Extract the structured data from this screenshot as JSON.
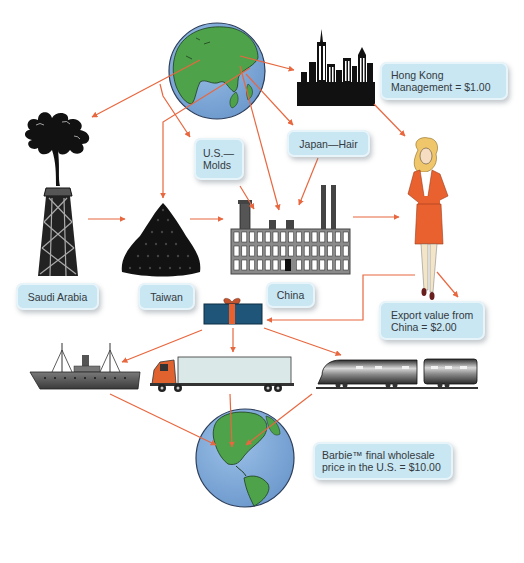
{
  "diagram": {
    "colors": {
      "arrow": "#e8673f",
      "label_bg": "#c9e6f3",
      "label_text": "#333a40",
      "ocean": "#7fa9d9",
      "land": "#3e9b3a",
      "suit": "#e9612f",
      "gift_box": "#1f5578",
      "gift_ribbon": "#e9612f"
    },
    "labels": {
      "hong_kong": [
        "Hong Kong",
        "Management = $1.00"
      ],
      "us_molds": [
        "U.S.—",
        "Molds"
      ],
      "japan_hair": "Japan—Hair",
      "saudi_arabia": "Saudi Arabia",
      "taiwan": "Taiwan",
      "china": "China",
      "export_value": [
        "Export value from",
        "China = $2.00"
      ],
      "final_price": [
        "Barbie™ final wholesale",
        "price in the U.S. = $10.00"
      ]
    },
    "nodes": [
      {
        "id": "globe-asia",
        "icon": "globe-asia-icon"
      },
      {
        "id": "hong-kong-city",
        "icon": "city-skyline-icon"
      },
      {
        "id": "saudi-oil",
        "icon": "oil-derrick-icon"
      },
      {
        "id": "taiwan-pellets",
        "icon": "plastic-pellets-icon"
      },
      {
        "id": "china-factory",
        "icon": "factory-icon"
      },
      {
        "id": "barbie-doll",
        "icon": "woman-figure-icon"
      },
      {
        "id": "gift-box",
        "icon": "gift-box-icon"
      },
      {
        "id": "ship",
        "icon": "ship-icon"
      },
      {
        "id": "truck",
        "icon": "truck-icon"
      },
      {
        "id": "train",
        "icon": "train-icon"
      },
      {
        "id": "globe-americas",
        "icon": "globe-americas-icon"
      }
    ],
    "flows": [
      {
        "from": "globe-asia",
        "to": "hong-kong-city"
      },
      {
        "from": "globe-asia",
        "to": "saudi-oil"
      },
      {
        "from": "globe-asia",
        "to": "taiwan-pellets"
      },
      {
        "from": "globe-asia",
        "to": "us-molds"
      },
      {
        "from": "globe-asia",
        "to": "japan-hair"
      },
      {
        "from": "globe-asia",
        "to": "china-factory"
      },
      {
        "from": "hong-kong-city",
        "to": "barbie-doll"
      },
      {
        "from": "saudi-oil",
        "to": "taiwan-pellets"
      },
      {
        "from": "taiwan-pellets",
        "to": "china-factory"
      },
      {
        "from": "us-molds",
        "to": "china-factory"
      },
      {
        "from": "japan-hair",
        "to": "china-factory"
      },
      {
        "from": "china-factory",
        "to": "barbie-doll"
      },
      {
        "from": "barbie-doll",
        "to": "export-value"
      },
      {
        "from": "barbie-doll",
        "to": "gift-box"
      },
      {
        "from": "gift-box",
        "to": "ship"
      },
      {
        "from": "gift-box",
        "to": "truck"
      },
      {
        "from": "gift-box",
        "to": "train"
      },
      {
        "from": "ship",
        "to": "globe-americas"
      },
      {
        "from": "truck",
        "to": "globe-americas"
      },
      {
        "from": "train",
        "to": "globe-americas"
      }
    ]
  }
}
